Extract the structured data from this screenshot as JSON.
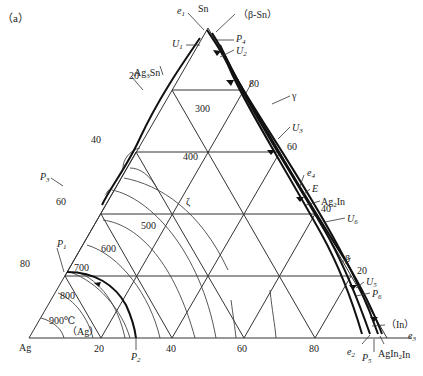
{
  "figure": {
    "panel_label": "（a）",
    "vertices": {
      "left": "Ag",
      "top": "Sn",
      "right": "In"
    },
    "grid_ticks": [
      "20",
      "40",
      "60",
      "80"
    ],
    "left_edge_ticks": [
      "20",
      "40",
      "60",
      "80"
    ],
    "right_edge_ticks": [
      "80",
      "60",
      "40",
      "20"
    ],
    "bottom_ticks": [
      "20",
      "40",
      "60",
      "80"
    ],
    "isotherms": [
      "300",
      "400",
      "500",
      "600",
      "700",
      "800",
      "900℃"
    ],
    "phases": {
      "beta_sn": "（β-Sn）",
      "gamma": "γ",
      "zeta": "ζ",
      "beta": "β",
      "ag_solid": "（Ag）",
      "in_solid": "（In）",
      "ag3sn": "Ag3Sn",
      "ag2in": "Ag2In",
      "agin2": "AgIn2"
    },
    "invariant_points": {
      "e1": "e1",
      "e2": "e2",
      "e3": "e3",
      "e4": "e4",
      "E": "E",
      "U1": "U1",
      "U2": "U2",
      "U3": "U3",
      "U5": "U5",
      "U6": "U6",
      "P1": "P1",
      "P2": "P2",
      "P3": "P3",
      "P4": "P4",
      "P5": "P5",
      "P6": "P6"
    }
  }
}
